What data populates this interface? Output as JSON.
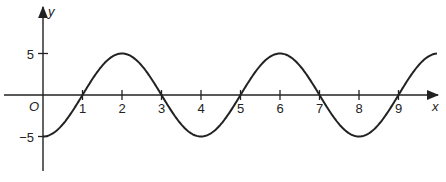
{
  "chart_data": {
    "type": "line",
    "title": "",
    "xlabel": "x",
    "ylabel": "y",
    "origin_label": "O",
    "function": "y = -5cos(pi x / 2)",
    "x_ticks": [
      1,
      2,
      3,
      4,
      5,
      6,
      7,
      8,
      9
    ],
    "x_tick_labels": [
      "1",
      "2",
      "3",
      "4",
      "5",
      "6",
      "7",
      "8",
      "9"
    ],
    "y_ticks": [
      5,
      -5
    ],
    "y_tick_labels": [
      "5",
      "−5"
    ],
    "xlim": [
      -1,
      10
    ],
    "ylim": [
      -8,
      9
    ],
    "grid": false,
    "series": [
      {
        "name": "curve",
        "x": [
          0,
          1,
          2,
          3,
          4,
          5,
          6,
          7,
          8,
          9,
          10
        ],
        "y": [
          -5,
          0,
          5,
          0,
          -5,
          0,
          5,
          0,
          -5,
          0,
          5
        ]
      }
    ],
    "color": "#222222"
  }
}
